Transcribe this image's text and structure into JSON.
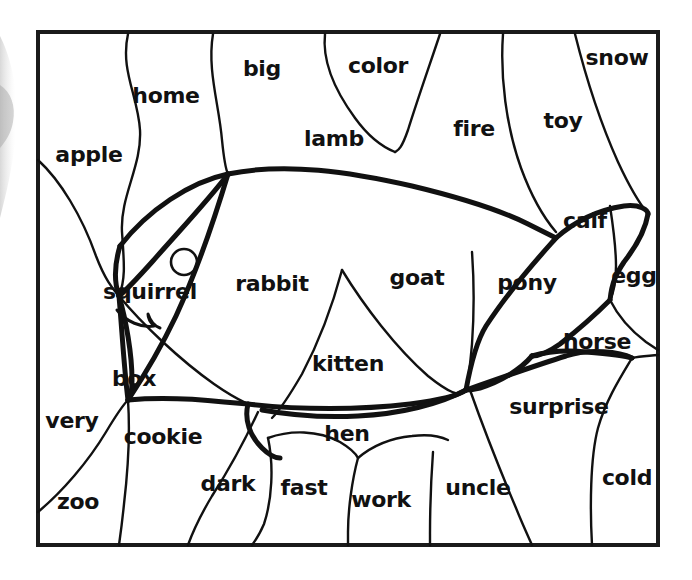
{
  "worksheet": {
    "type": "color-by-word hidden picture",
    "hidden_picture": "fish",
    "frame": {
      "x": 38,
      "y": 32,
      "width": 620,
      "height": 513,
      "stroke_color": "#1a1a1a",
      "stroke_width": 4
    },
    "ink_color": "#111111",
    "background_color": "#ffffff",
    "word_count": 26
  },
  "words": [
    {
      "id": "apple",
      "label": "apple",
      "x": 89,
      "y": 156,
      "size": 22
    },
    {
      "id": "home",
      "label": "home",
      "x": 166,
      "y": 97,
      "size": 22
    },
    {
      "id": "big",
      "label": "big",
      "x": 262,
      "y": 70,
      "size": 22
    },
    {
      "id": "color",
      "label": "color",
      "x": 378,
      "y": 67,
      "size": 22
    },
    {
      "id": "snow",
      "label": "snow",
      "x": 617,
      "y": 59,
      "size": 22
    },
    {
      "id": "fire",
      "label": "fire",
      "x": 474,
      "y": 130,
      "size": 22
    },
    {
      "id": "toy",
      "label": "toy",
      "x": 563,
      "y": 122,
      "size": 22
    },
    {
      "id": "lamb",
      "label": "lamb",
      "x": 334,
      "y": 140,
      "size": 22
    },
    {
      "id": "calf",
      "label": "calf",
      "x": 585,
      "y": 222,
      "size": 22
    },
    {
      "id": "squirrel",
      "label": "squirrel",
      "x": 150,
      "y": 293,
      "size": 22
    },
    {
      "id": "rabbit",
      "label": "rabbit",
      "x": 272,
      "y": 285,
      "size": 22
    },
    {
      "id": "goat",
      "label": "goat",
      "x": 417,
      "y": 279,
      "size": 22
    },
    {
      "id": "pony",
      "label": "pony",
      "x": 527,
      "y": 284,
      "size": 22
    },
    {
      "id": "egg",
      "label": "egg",
      "x": 634,
      "y": 277,
      "size": 22
    },
    {
      "id": "horse",
      "label": "horse",
      "x": 597,
      "y": 343,
      "size": 22
    },
    {
      "id": "kitten",
      "label": "kitten",
      "x": 348,
      "y": 365,
      "size": 22
    },
    {
      "id": "box",
      "label": "box",
      "x": 134,
      "y": 380,
      "size": 22
    },
    {
      "id": "surprise",
      "label": "surprise",
      "x": 559,
      "y": 408,
      "size": 22
    },
    {
      "id": "very",
      "label": "very",
      "x": 72,
      "y": 422,
      "size": 22
    },
    {
      "id": "cookie",
      "label": "cookie",
      "x": 163,
      "y": 438,
      "size": 22
    },
    {
      "id": "hen",
      "label": "hen",
      "x": 347,
      "y": 435,
      "size": 22
    },
    {
      "id": "dark",
      "label": "dark",
      "x": 228,
      "y": 485,
      "size": 22
    },
    {
      "id": "fast",
      "label": "fast",
      "x": 304,
      "y": 489,
      "size": 22
    },
    {
      "id": "work",
      "label": "work",
      "x": 381,
      "y": 501,
      "size": 22
    },
    {
      "id": "uncle",
      "label": "uncle",
      "x": 478,
      "y": 489,
      "size": 22
    },
    {
      "id": "cold",
      "label": "cold",
      "x": 627,
      "y": 479,
      "size": 22
    },
    {
      "id": "zoo",
      "label": "zoo",
      "x": 78,
      "y": 503,
      "size": 22
    }
  ],
  "fish_features": {
    "eye": {
      "cx": 184,
      "cy": 262,
      "r": 13,
      "stroke_width": 2.5
    },
    "mouth_label": "fish-mouth-hook"
  },
  "region_lines": {
    "thin_stroke": 2.2,
    "thick_stroke": 5,
    "description": "curved boundary lines dividing the frame into 26 lettered regions forming a fish"
  }
}
